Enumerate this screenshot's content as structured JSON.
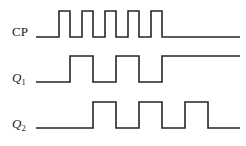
{
  "figure": {
    "kind": "digital-timing-diagram",
    "background_color": "#ffffff",
    "line_color": "#262626",
    "width": 246,
    "height": 146
  },
  "signals": [
    {
      "id": "cp",
      "label": "CP",
      "label_style": "upright",
      "subscript": "",
      "description": "clock pulse train, 5 pulses",
      "baseline_y": 37,
      "high_y": 11,
      "lead_in_x": 36,
      "tail_out_x": 240,
      "transitions_x": [
        59,
        70,
        82,
        93,
        105,
        116,
        128,
        139,
        151,
        162
      ],
      "levels": [
        0,
        1,
        0,
        1,
        0,
        1,
        0,
        1,
        0,
        1,
        0
      ]
    },
    {
      "id": "q1",
      "label": "Q",
      "label_style": "italic",
      "subscript": "1",
      "description": "divide-by-2 output, toggles on clock falling edges",
      "baseline_y": 82,
      "high_y": 56,
      "lead_in_x": 36,
      "tail_out_x": 240,
      "transitions_x": [
        70,
        93,
        116,
        139,
        162
      ],
      "levels": [
        0,
        1,
        0,
        1,
        0,
        1
      ]
    },
    {
      "id": "q2",
      "label": "Q",
      "label_style": "italic",
      "subscript": "2",
      "description": "divide-by-4 output, toggles on Q1 falling edges",
      "baseline_y": 128,
      "high_y": 102,
      "lead_in_x": 36,
      "tail_out_x": 240,
      "transitions_x": [
        93,
        116,
        139,
        162,
        185,
        208
      ],
      "levels": [
        0,
        1,
        0,
        1,
        0,
        1,
        0
      ]
    }
  ],
  "chart_data": {
    "type": "line",
    "title": "",
    "xlabel": "",
    "ylabel": "",
    "series": [
      {
        "name": "CP",
        "edges_x": [
          36,
          59,
          70,
          82,
          93,
          105,
          116,
          128,
          139,
          151,
          162,
          240
        ],
        "levels": [
          0,
          1,
          0,
          1,
          0,
          1,
          0,
          1,
          0,
          1,
          0
        ]
      },
      {
        "name": "Q1",
        "edges_x": [
          36,
          70,
          93,
          116,
          139,
          162,
          240
        ],
        "levels": [
          0,
          1,
          0,
          1,
          0,
          1
        ]
      },
      {
        "name": "Q2",
        "edges_x": [
          36,
          93,
          116,
          139,
          162,
          185,
          208,
          240
        ],
        "levels": [
          0,
          1,
          0,
          1,
          0,
          1,
          0
        ]
      }
    ],
    "legend_position": "left-labels",
    "grid": false
  }
}
